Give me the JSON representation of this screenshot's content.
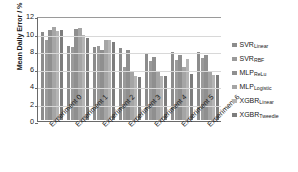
{
  "chart_data": {
    "type": "bar",
    "title": "",
    "xlabel": "",
    "ylabel": "Mean Daily Error / %",
    "ylim": [
      0,
      12
    ],
    "yticks": [
      0,
      2,
      4,
      6,
      8,
      10,
      12
    ],
    "grid": true,
    "legend_position": "right",
    "categories": [
      "Experiment 0",
      "Experiment 1",
      "Experiment 2",
      "Experiment 3",
      "Experiment 4",
      "Experiment 5",
      "Experiment 6"
    ],
    "series": [
      {
        "name": "SVR",
        "subscript": "Linear",
        "color": "#8c8c8c",
        "values": [
          10.1,
          8.5,
          8.4,
          8.2,
          7.7,
          7.75,
          7.75
        ]
      },
      {
        "name": "SVR",
        "subscript": "RBF",
        "color": "#9a9a9a",
        "values": [
          9.2,
          8.4,
          8.5,
          6.1,
          6.8,
          6.9,
          7.1
        ]
      },
      {
        "name": "MLP",
        "subscript": "ReLu",
        "color": "#8f8f8f",
        "values": [
          10.3,
          10.4,
          8.0,
          8.0,
          7.2,
          7.4,
          7.4
        ]
      },
      {
        "name": "MLP",
        "subscript": "Logistic",
        "color": "#a5a5a5",
        "values": [
          10.6,
          10.5,
          9.1,
          5.6,
          5.6,
          6.1,
          5.6
        ]
      },
      {
        "name": "XGBR",
        "subscript": "Linear",
        "color": "#b5b5b5",
        "values": [
          10.2,
          9.7,
          9.2,
          5.0,
          5.0,
          7.0,
          5.2
        ]
      },
      {
        "name": "XGBR",
        "subscript": "Tweedie",
        "color": "#7d7d7d",
        "values": [
          10.3,
          9.4,
          8.9,
          4.95,
          5.0,
          5.3,
          5.1
        ]
      }
    ]
  },
  "axis": {
    "y_title": "Mean Daily Error / %",
    "y_tick_labels": [
      "12",
      "10",
      "8",
      "6",
      "4",
      "2",
      "0"
    ]
  },
  "legend": {
    "items": [
      {
        "name": "SVR",
        "subscript": "Linear"
      },
      {
        "name": "SVR",
        "subscript": "RBF"
      },
      {
        "name": "MLP",
        "subscript": "ReLu"
      },
      {
        "name": "MLP",
        "subscript": "Logistic"
      },
      {
        "name": "XGBR",
        "subscript": "Linear"
      },
      {
        "name": "XGBR",
        "subscript": "Tweedie"
      }
    ]
  },
  "colors": {
    "axis": "#6a6a6a",
    "grid": "#d8d8d8",
    "background": "#ffffff",
    "text": "#1a1a1a"
  }
}
